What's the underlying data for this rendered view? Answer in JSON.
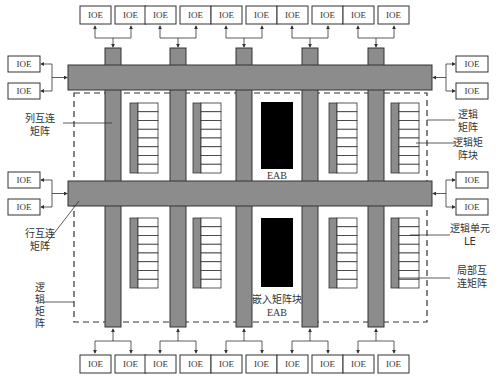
{
  "diagram": {
    "io_element_label": "IOE",
    "top_ioe_count": 10,
    "bottom_ioe_count": 10,
    "left_ioe_count": 4,
    "right_ioe_count": 4,
    "column_interconnect_count": 5,
    "row_interconnect_count": 2,
    "logic_cells_per_lab": 8,
    "eab_label_top": "EAB",
    "eab_label_bottom_line1": "嵌入矩阵块",
    "eab_label_bottom_line2": "EAB",
    "callouts": {
      "column_interconnect": [
        "列互连",
        "矩阵"
      ],
      "row_interconnect": [
        "行互连",
        "矩阵"
      ],
      "logic_array_left": [
        "逻",
        "辑",
        "矩",
        "阵"
      ],
      "logic_array_right": [
        "逻辑",
        "矩阵"
      ],
      "logic_array_block": [
        "逻辑矩",
        "阵块"
      ],
      "logic_element": [
        "逻辑单元",
        "LE"
      ],
      "local_interconnect": [
        "局部互",
        "连矩阵"
      ]
    }
  }
}
